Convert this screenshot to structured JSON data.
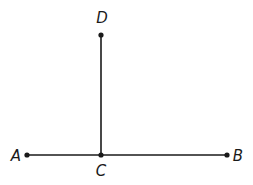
{
  "diagram": {
    "type": "geometry",
    "color": "#1a1a1a",
    "points": [
      {
        "id": "A",
        "label": "A",
        "x": 27,
        "y": 155,
        "lx": 16,
        "ly": 161
      },
      {
        "id": "B",
        "label": "B",
        "x": 227,
        "y": 155,
        "lx": 238,
        "ly": 161
      },
      {
        "id": "C",
        "label": "C",
        "x": 101,
        "y": 155,
        "lx": 101,
        "ly": 176
      },
      {
        "id": "D",
        "label": "D",
        "x": 101,
        "y": 35,
        "lx": 102,
        "ly": 23
      }
    ],
    "segments": [
      {
        "from": "A",
        "to": "B"
      },
      {
        "from": "C",
        "to": "D"
      }
    ]
  }
}
